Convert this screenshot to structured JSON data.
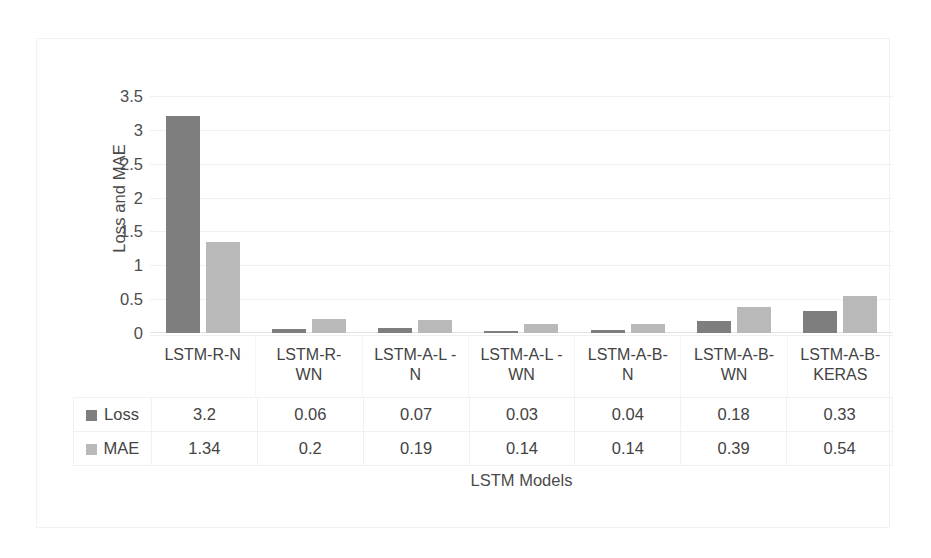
{
  "chart_data": {
    "type": "bar",
    "title": "",
    "xlabel": "LSTM Models",
    "ylabel": "Loss and MAE",
    "categories": [
      "LSTM-R-N",
      "LSTM-R-\nWN",
      "LSTM-A-L -\nN",
      "LSTM-A-L -\nWN",
      "LSTM-A-B-\nN",
      "LSTM-A-B-\nWN",
      "LSTM-A-B-\nKERAS"
    ],
    "category_lines": [
      [
        "LSTM-R-N",
        ""
      ],
      [
        "LSTM-R-",
        "WN"
      ],
      [
        "LSTM-A-L -",
        "N"
      ],
      [
        "LSTM-A-L -",
        "WN"
      ],
      [
        "LSTM-A-B-",
        "N"
      ],
      [
        "LSTM-A-B-",
        "WN"
      ],
      [
        "LSTM-A-B-",
        "KERAS"
      ]
    ],
    "series": [
      {
        "name": "Loss",
        "color": "#7e7e7e",
        "values": [
          3.2,
          0.06,
          0.07,
          0.03,
          0.04,
          0.18,
          0.33
        ]
      },
      {
        "name": "MAE",
        "color": "#b9b9b9",
        "values": [
          1.34,
          0.2,
          0.19,
          0.14,
          0.14,
          0.39,
          0.54
        ]
      }
    ],
    "ylim": [
      0,
      3.5
    ],
    "yticks": [
      "3.5",
      "3",
      "2.5",
      "2",
      "1.5",
      "1",
      "0.5",
      "0"
    ],
    "ytick_values": [
      3.5,
      3,
      2.5,
      2,
      1.5,
      1,
      0.5,
      0
    ],
    "grid": true,
    "legend_position": "table-left",
    "data_table_visible": true
  },
  "axes": {
    "y_title": "Loss and MAE",
    "x_title": "LSTM Models"
  },
  "table": {
    "rows": [
      {
        "label": "Loss",
        "swatch": "loss-swatch-icon",
        "cells": [
          "3.2",
          "0.06",
          "0.07",
          "0.03",
          "0.04",
          "0.18",
          "0.33"
        ]
      },
      {
        "label": "MAE",
        "swatch": "mae-swatch-icon",
        "cells": [
          "1.34",
          "0.2",
          "0.19",
          "0.14",
          "0.14",
          "0.39",
          "0.54"
        ]
      }
    ]
  },
  "colors": {
    "loss": "#7e7e7e",
    "mae": "#b9b9b9",
    "gridline": "#f0f0f0",
    "frame": "#f2f2f2",
    "text": "#434343"
  }
}
